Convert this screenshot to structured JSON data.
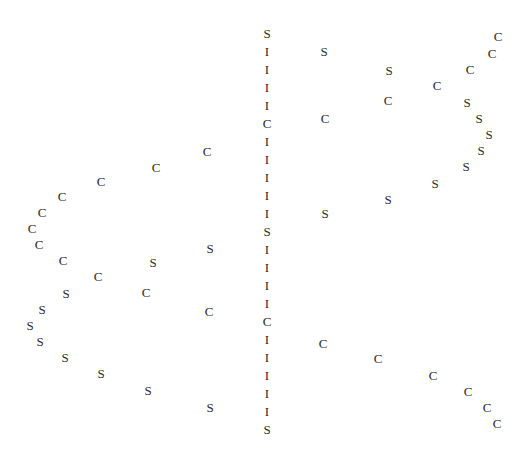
{
  "figure": {
    "background_color": "#ffffff",
    "glyph_color": "#2b2b2b",
    "width": 532,
    "height": 449
  },
  "chart_data": {
    "type": "scatter",
    "title": "",
    "subtitle": "",
    "xlabel": "",
    "ylabel": "",
    "xlim": [
      0,
      532
    ],
    "ylim": [
      0,
      449
    ],
    "grid": false,
    "legend": null,
    "axes_visible": false,
    "tick_labels_x": [],
    "tick_labels_y": [],
    "marker_style": "text-label",
    "class_labels": [
      "C",
      "S",
      "I"
    ],
    "points": [
      {
        "label": "C",
        "x": 207,
        "y": 151
      },
      {
        "label": "C",
        "x": 156,
        "y": 167
      },
      {
        "label": "C",
        "x": 101,
        "y": 181
      },
      {
        "label": "C",
        "x": 62,
        "y": 196
      },
      {
        "label": "C",
        "x": 42,
        "y": 212
      },
      {
        "label": "C",
        "x": 32,
        "y": 228
      },
      {
        "label": "C",
        "x": 39,
        "y": 244
      },
      {
        "label": "C",
        "x": 63,
        "y": 260
      },
      {
        "label": "C",
        "x": 98,
        "y": 276
      },
      {
        "label": "C",
        "x": 146,
        "y": 292
      },
      {
        "label": "C",
        "x": 209,
        "y": 311
      },
      {
        "label": "S",
        "x": 210,
        "y": 248
      },
      {
        "label": "S",
        "x": 153,
        "y": 262
      },
      {
        "label": "S",
        "x": 66,
        "y": 293
      },
      {
        "label": "S",
        "x": 42,
        "y": 309
      },
      {
        "label": "S",
        "x": 30,
        "y": 325
      },
      {
        "label": "S",
        "x": 40,
        "y": 341
      },
      {
        "label": "S",
        "x": 65,
        "y": 357
      },
      {
        "label": "S",
        "x": 101,
        "y": 373
      },
      {
        "label": "S",
        "x": 148,
        "y": 390
      },
      {
        "label": "S",
        "x": 210,
        "y": 407
      },
      {
        "label": "S",
        "x": 267,
        "y": 33
      },
      {
        "label": "I",
        "x": 267,
        "y": 51
      },
      {
        "label": "I",
        "x": 267,
        "y": 69
      },
      {
        "label": "I",
        "x": 267,
        "y": 87
      },
      {
        "label": "I",
        "x": 267,
        "y": 105
      },
      {
        "label": "C",
        "x": 267,
        "y": 123
      },
      {
        "label": "I",
        "x": 267,
        "y": 141
      },
      {
        "label": "I",
        "x": 267,
        "y": 159
      },
      {
        "label": "I",
        "x": 267,
        "y": 177
      },
      {
        "label": "I",
        "x": 267,
        "y": 195
      },
      {
        "label": "I",
        "x": 267,
        "y": 213
      },
      {
        "label": "S",
        "x": 267,
        "y": 231
      },
      {
        "label": "I",
        "x": 267,
        "y": 249
      },
      {
        "label": "I",
        "x": 267,
        "y": 267
      },
      {
        "label": "I",
        "x": 267,
        "y": 285
      },
      {
        "label": "I",
        "x": 267,
        "y": 303
      },
      {
        "label": "C",
        "x": 267,
        "y": 321
      },
      {
        "label": "I",
        "x": 267,
        "y": 339
      },
      {
        "label": "I",
        "x": 267,
        "y": 357
      },
      {
        "label": "I",
        "x": 267,
        "y": 375
      },
      {
        "label": "I",
        "x": 267,
        "y": 393
      },
      {
        "label": "I",
        "x": 267,
        "y": 411
      },
      {
        "label": "S",
        "x": 267,
        "y": 429
      },
      {
        "label": "S",
        "x": 324,
        "y": 51
      },
      {
        "label": "S",
        "x": 389,
        "y": 70
      },
      {
        "label": "S",
        "x": 388,
        "y": 199
      },
      {
        "label": "S",
        "x": 325,
        "y": 213
      },
      {
        "label": "S",
        "x": 435,
        "y": 183
      },
      {
        "label": "S",
        "x": 466,
        "y": 166
      },
      {
        "label": "S",
        "x": 481,
        "y": 150
      },
      {
        "label": "S",
        "x": 489,
        "y": 134
      },
      {
        "label": "S",
        "x": 479,
        "y": 118
      },
      {
        "label": "S",
        "x": 467,
        "y": 102
      },
      {
        "label": "C",
        "x": 325,
        "y": 118
      },
      {
        "label": "C",
        "x": 388,
        "y": 100
      },
      {
        "label": "C",
        "x": 437,
        "y": 85
      },
      {
        "label": "C",
        "x": 470,
        "y": 69
      },
      {
        "label": "C",
        "x": 492,
        "y": 53
      },
      {
        "label": "C",
        "x": 498,
        "y": 36
      },
      {
        "label": "C",
        "x": 323,
        "y": 343
      },
      {
        "label": "C",
        "x": 378,
        "y": 358
      },
      {
        "label": "C",
        "x": 433,
        "y": 375
      },
      {
        "label": "C",
        "x": 468,
        "y": 391
      },
      {
        "label": "C",
        "x": 487,
        "y": 407
      },
      {
        "label": "C",
        "x": 497,
        "y": 423
      }
    ]
  }
}
